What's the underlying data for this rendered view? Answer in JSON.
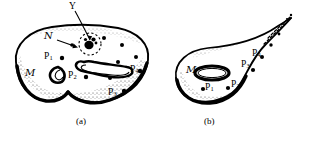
{
  "figure": {
    "background_color": "#ffffff",
    "ink_color": "#000000",
    "caption_a": "(a)",
    "caption_b": "(b)",
    "panels": [
      {
        "id": "a",
        "caption": "(a)",
        "description": "Two-lobed shaded manifold M with slit-shaped holes, a neighborhood N containing a marked point set Y, and four marked points.",
        "labels": [
          {
            "name": "Y",
            "text": "Y",
            "sub": "",
            "x": 71,
            "y": 5,
            "style": "plain"
          },
          {
            "name": "N",
            "text": "N",
            "sub": "",
            "x": 45,
            "y": 36,
            "style": "script"
          },
          {
            "name": "M",
            "text": "M",
            "sub": "",
            "x": 27,
            "y": 73,
            "style": "script"
          },
          {
            "name": "P1",
            "text": "P",
            "sub": "1",
            "x": 46,
            "y": 57,
            "style": "plain"
          },
          {
            "name": "P2",
            "text": "P",
            "sub": "2",
            "x": 70,
            "y": 76,
            "style": "plain"
          },
          {
            "name": "P3",
            "text": "P",
            "sub": "3",
            "x": 110,
            "y": 93,
            "style": "plain"
          },
          {
            "name": "P4",
            "text": "P",
            "sub": "4",
            "x": 132,
            "y": 70,
            "style": "plain"
          }
        ],
        "dots": [
          {
            "x": 62,
            "y": 58
          },
          {
            "x": 86,
            "y": 77
          },
          {
            "x": 124,
            "y": 91
          },
          {
            "x": 140,
            "y": 71
          },
          {
            "x": 104,
            "y": 38
          },
          {
            "x": 122,
            "y": 45
          },
          {
            "x": 136,
            "y": 57
          },
          {
            "x": 118,
            "y": 62
          },
          {
            "x": 94,
            "y": 47
          },
          {
            "x": 110,
            "y": 76
          },
          {
            "x": 90,
            "y": 36
          }
        ],
        "neighborhood_circle": {
          "cx": 90,
          "cy": 44,
          "r": 11
        }
      },
      {
        "id": "b",
        "caption": "(b)",
        "description": "Tear-drop manifold M with an elliptical hole and a tapering dashed tail, with four marked points.",
        "labels": [
          {
            "name": "M",
            "text": "M",
            "sub": "",
            "x": 188,
            "y": 70,
            "style": "script"
          },
          {
            "name": "P1",
            "text": "P",
            "sub": "1",
            "x": 206,
            "y": 87,
            "style": "plain"
          },
          {
            "name": "P2",
            "text": "P",
            "sub": "2",
            "x": 232,
            "y": 84,
            "style": "plain"
          },
          {
            "name": "P3",
            "text": "P",
            "sub": "3",
            "x": 243,
            "y": 65,
            "style": "plain"
          },
          {
            "name": "P4",
            "text": "P",
            "sub": "4",
            "x": 254,
            "y": 54,
            "style": "plain"
          }
        ],
        "dots": [
          {
            "x": 203,
            "y": 89
          },
          {
            "x": 228,
            "y": 88
          },
          {
            "x": 253,
            "y": 70
          },
          {
            "x": 262,
            "y": 57
          },
          {
            "x": 270,
            "y": 45
          },
          {
            "x": 277,
            "y": 36
          }
        ],
        "hole_ellipse": {
          "cx": 212,
          "cy": 73,
          "rx": 17,
          "ry": 7
        }
      }
    ]
  }
}
